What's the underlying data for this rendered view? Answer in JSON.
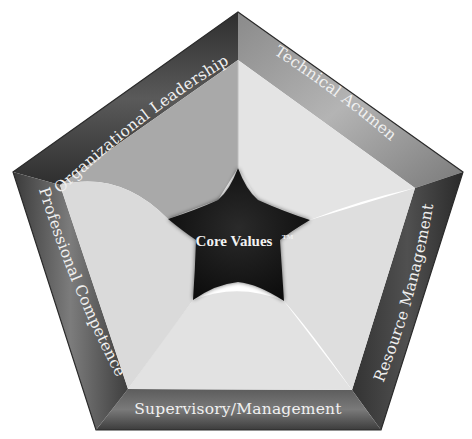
{
  "diagram": {
    "title": "Core Values",
    "center": {
      "label": "Core Values",
      "trademark": "TM"
    },
    "sides": [
      {
        "id": "organizational-leadership",
        "label": "Organizational Leadership",
        "position": "upper-left"
      },
      {
        "id": "technical-acumen",
        "label": "Technical Acumen",
        "position": "upper-right"
      },
      {
        "id": "resource-management",
        "label": "Resource Management",
        "position": "right"
      },
      {
        "id": "supervisory-management",
        "label": "Supervisory/Management",
        "position": "bottom"
      },
      {
        "id": "professional-competence",
        "label": "Professional Competence",
        "position": "left"
      }
    ],
    "colors": {
      "frame_dark": "#3a3a3a",
      "frame_mid": "#6e6e6e",
      "frame_light": "#9a9a9a",
      "facet_dark": "#a9a9a9",
      "facet_light": "#dcdcdc",
      "facet_lighter": "#e6e6e6",
      "star": "#121212",
      "text": "#f0f0f0"
    }
  }
}
